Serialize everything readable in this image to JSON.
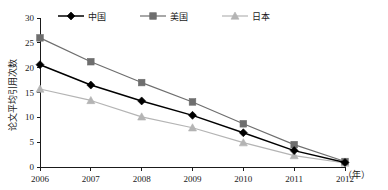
{
  "chart_data": {
    "type": "line",
    "title": "",
    "xlabel": "（年）",
    "ylabel": "论文平均引用次数",
    "x": [
      "2006",
      "2007",
      "2008",
      "2009",
      "2010",
      "2011",
      "2012"
    ],
    "categories": [
      "2006",
      "2007",
      "2008",
      "2009",
      "2010",
      "2011",
      "2012"
    ],
    "xlim": [
      2006,
      2012
    ],
    "ylim": [
      0,
      30
    ],
    "yticks": [
      "0",
      "5",
      "10",
      "15",
      "20",
      "25",
      "30"
    ],
    "ytick_values": [
      0,
      5,
      10,
      15,
      20,
      25,
      30
    ],
    "grid": false,
    "legend_position": "top",
    "series": [
      {
        "name": "中国",
        "marker": "diamond",
        "color": "#000000",
        "values": [
          20.6,
          16.5,
          13.3,
          10.4,
          6.9,
          3.3,
          0.9
        ]
      },
      {
        "name": "美国",
        "marker": "square",
        "color": "#6e6e6e",
        "values": [
          26.0,
          21.2,
          17.0,
          13.1,
          8.7,
          4.5,
          1.1
        ]
      },
      {
        "name": "日本",
        "marker": "triangle",
        "color": "#b4b4b4",
        "values": [
          15.7,
          13.4,
          10.1,
          7.9,
          4.9,
          2.3,
          0.8
        ]
      }
    ]
  },
  "colors": {
    "axis": "#1a1a1a",
    "background": "#ffffff",
    "series_china": "#000000",
    "series_usa": "#6e6e6e",
    "series_japan": "#b4b4b4"
  }
}
